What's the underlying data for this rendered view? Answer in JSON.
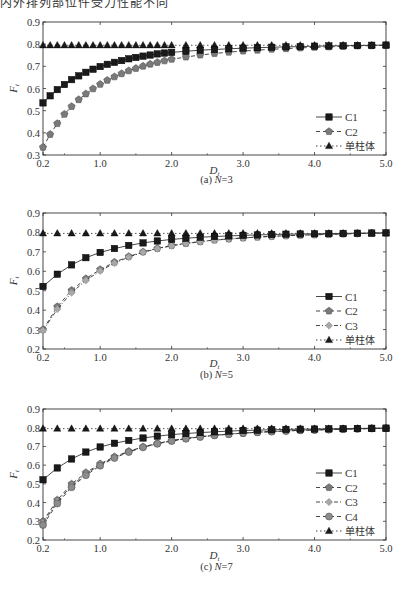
{
  "page": {
    "top_text": "内外排列部位件受力性能不同"
  },
  "chart_data": [
    {
      "type": "line",
      "title": "",
      "caption": "(a) N=3",
      "caption_prefix": "(a) ",
      "caption_var": "N",
      "caption_value": "=3",
      "xlabel": "D",
      "xlabel_sub": "t",
      "ylabel": "F",
      "ylabel_sub": "t",
      "xlim": [
        0.2,
        5.0
      ],
      "ylim": [
        0.3,
        0.9
      ],
      "xticks": [
        0.2,
        1.0,
        2.0,
        3.0,
        4.0,
        5.0
      ],
      "xtick_labels": [
        "0.2",
        "1.0",
        "2.0",
        "3.0",
        "4.0",
        "5.0"
      ],
      "yticks": [
        0.3,
        0.4,
        0.5,
        0.6,
        0.7,
        0.8,
        0.9
      ],
      "ytick_labels": [
        "0.3",
        "0.4",
        "0.5",
        "0.6",
        "0.7",
        "0.8",
        "0.9"
      ],
      "grid": false,
      "legend_position": "lower right",
      "x": [
        0.2,
        0.3,
        0.4,
        0.5,
        0.6,
        0.7,
        0.8,
        0.9,
        1.0,
        1.1,
        1.2,
        1.3,
        1.4,
        1.5,
        1.6,
        1.7,
        1.8,
        1.9,
        2.0,
        2.2,
        2.4,
        2.6,
        2.8,
        3.0,
        3.2,
        3.4,
        3.6,
        3.8,
        4.0,
        4.2,
        4.4,
        4.6,
        4.8,
        5.0
      ],
      "series": [
        {
          "name": "C1",
          "style": "solid",
          "marker": "square",
          "color": "#1a1a1a",
          "values": [
            0.535,
            0.567,
            0.595,
            0.618,
            0.64,
            0.657,
            0.673,
            0.687,
            0.699,
            0.709,
            0.718,
            0.726,
            0.734,
            0.74,
            0.746,
            0.751,
            0.756,
            0.76,
            0.763,
            0.768,
            0.773,
            0.776,
            0.779,
            0.782,
            0.784,
            0.786,
            0.788,
            0.789,
            0.791,
            0.792,
            0.793,
            0.794,
            0.795,
            0.796
          ]
        },
        {
          "name": "C2",
          "style": "dashed",
          "marker": "pentagon",
          "color": "#7a7a7a",
          "values": [
            0.335,
            0.393,
            0.442,
            0.484,
            0.519,
            0.55,
            0.576,
            0.599,
            0.619,
            0.637,
            0.653,
            0.667,
            0.68,
            0.691,
            0.701,
            0.71,
            0.718,
            0.725,
            0.732,
            0.742,
            0.751,
            0.758,
            0.764,
            0.769,
            0.773,
            0.777,
            0.78,
            0.783,
            0.786,
            0.788,
            0.79,
            0.792,
            0.793,
            0.795
          ]
        },
        {
          "name": "单柱体",
          "style": "dotted",
          "marker": "triangle",
          "color": "#1a1a1a",
          "values": [
            0.795,
            0.795,
            0.795,
            0.795,
            0.795,
            0.795,
            0.795,
            0.795,
            0.795,
            0.795,
            0.795,
            0.795,
            0.795,
            0.795,
            0.795,
            0.795,
            0.795,
            0.795,
            0.795,
            0.795,
            0.795,
            0.795,
            0.795,
            0.795,
            0.795,
            0.795,
            0.795,
            0.795,
            0.795,
            0.795,
            0.795,
            0.795,
            0.795,
            0.795
          ]
        }
      ]
    },
    {
      "type": "line",
      "title": "",
      "caption": "(b) N=5",
      "caption_prefix": "(b) ",
      "caption_var": "N",
      "caption_value": "=5",
      "xlabel": "D",
      "xlabel_sub": "t",
      "ylabel": "F",
      "ylabel_sub": "t",
      "xlim": [
        0.2,
        5.0
      ],
      "ylim": [
        0.2,
        0.9
      ],
      "xticks": [
        0.2,
        1.0,
        2.0,
        3.0,
        4.0,
        5.0
      ],
      "xtick_labels": [
        "0.2",
        "1.0",
        "2.0",
        "3.0",
        "4.0",
        "5.0"
      ],
      "yticks": [
        0.2,
        0.3,
        0.4,
        0.5,
        0.6,
        0.7,
        0.8,
        0.9
      ],
      "ytick_labels": [
        "0.2",
        "0.3",
        "0.4",
        "0.5",
        "0.6",
        "0.7",
        "0.8",
        "0.9"
      ],
      "grid": false,
      "legend_position": "lower right",
      "x": [
        0.2,
        0.4,
        0.6,
        0.8,
        1.0,
        1.2,
        1.4,
        1.6,
        1.8,
        2.0,
        2.2,
        2.4,
        2.6,
        2.8,
        3.0,
        3.2,
        3.4,
        3.6,
        3.8,
        4.0,
        4.2,
        4.4,
        4.6,
        4.8,
        5.0
      ],
      "series": [
        {
          "name": "C1",
          "style": "solid",
          "marker": "square",
          "color": "#1a1a1a",
          "values": [
            0.522,
            0.585,
            0.633,
            0.67,
            0.697,
            0.717,
            0.733,
            0.746,
            0.756,
            0.764,
            0.77,
            0.775,
            0.779,
            0.782,
            0.785,
            0.787,
            0.789,
            0.791,
            0.792,
            0.793,
            0.794,
            0.795,
            0.796,
            0.797,
            0.798
          ]
        },
        {
          "name": "C2",
          "style": "dashed",
          "marker": "pentagon",
          "color": "#7a7a7a",
          "values": [
            0.3,
            0.418,
            0.502,
            0.562,
            0.609,
            0.647,
            0.676,
            0.7,
            0.718,
            0.733,
            0.744,
            0.753,
            0.761,
            0.767,
            0.772,
            0.776,
            0.78,
            0.783,
            0.786,
            0.788,
            0.79,
            0.792,
            0.794,
            0.796,
            0.797
          ]
        },
        {
          "name": "C3",
          "style": "dashdot",
          "marker": "diamond",
          "color": "#a8a8a8",
          "values": [
            0.295,
            0.405,
            0.49,
            0.553,
            0.602,
            0.642,
            0.673,
            0.698,
            0.716,
            0.731,
            0.743,
            0.752,
            0.76,
            0.766,
            0.771,
            0.776,
            0.78,
            0.783,
            0.786,
            0.788,
            0.79,
            0.792,
            0.794,
            0.796,
            0.797
          ]
        },
        {
          "name": "单柱体",
          "style": "dotted",
          "marker": "triangle",
          "color": "#1a1a1a",
          "values": [
            0.795,
            0.795,
            0.795,
            0.795,
            0.795,
            0.795,
            0.795,
            0.795,
            0.795,
            0.795,
            0.795,
            0.795,
            0.795,
            0.795,
            0.795,
            0.795,
            0.795,
            0.795,
            0.795,
            0.795,
            0.795,
            0.795,
            0.795,
            0.795,
            0.795
          ]
        }
      ]
    },
    {
      "type": "line",
      "title": "",
      "caption": "(c) N=7",
      "caption_prefix": "(c) ",
      "caption_var": "N",
      "caption_value": "=7",
      "xlabel": "D",
      "xlabel_sub": "t",
      "ylabel": "F",
      "ylabel_sub": "t",
      "xlim": [
        0.2,
        5.0
      ],
      "ylim": [
        0.2,
        0.9
      ],
      "xticks": [
        0.2,
        1.0,
        2.0,
        3.0,
        4.0,
        5.0
      ],
      "xtick_labels": [
        "0.2",
        "1.0",
        "2.0",
        "3.0",
        "4.0",
        "5.0"
      ],
      "yticks": [
        0.2,
        0.3,
        0.4,
        0.5,
        0.6,
        0.7,
        0.8,
        0.9
      ],
      "ytick_labels": [
        "0.2",
        "0.3",
        "0.4",
        "0.5",
        "0.6",
        "0.7",
        "0.8",
        "0.9"
      ],
      "grid": false,
      "legend_position": "lower right",
      "x": [
        0.2,
        0.4,
        0.6,
        0.8,
        1.0,
        1.2,
        1.4,
        1.6,
        1.8,
        2.0,
        2.2,
        2.4,
        2.6,
        2.8,
        3.0,
        3.2,
        3.4,
        3.6,
        3.8,
        4.0,
        4.2,
        4.4,
        4.6,
        4.8,
        5.0
      ],
      "series": [
        {
          "name": "C1",
          "style": "solid",
          "marker": "square",
          "color": "#1a1a1a",
          "values": [
            0.522,
            0.585,
            0.633,
            0.67,
            0.697,
            0.717,
            0.732,
            0.745,
            0.755,
            0.763,
            0.769,
            0.774,
            0.778,
            0.782,
            0.785,
            0.787,
            0.789,
            0.791,
            0.792,
            0.793,
            0.794,
            0.795,
            0.796,
            0.797,
            0.798
          ]
        },
        {
          "name": "C2",
          "style": "dashed",
          "marker": "pentagon",
          "color": "#7a7a7a",
          "values": [
            0.3,
            0.414,
            0.499,
            0.56,
            0.607,
            0.645,
            0.674,
            0.698,
            0.716,
            0.731,
            0.743,
            0.752,
            0.76,
            0.766,
            0.771,
            0.776,
            0.78,
            0.783,
            0.786,
            0.788,
            0.79,
            0.792,
            0.794,
            0.796,
            0.797
          ]
        },
        {
          "name": "C3",
          "style": "dashdot",
          "marker": "diamond",
          "color": "#a8a8a8",
          "values": [
            0.29,
            0.405,
            0.49,
            0.553,
            0.602,
            0.642,
            0.672,
            0.697,
            0.715,
            0.73,
            0.742,
            0.751,
            0.759,
            0.766,
            0.771,
            0.776,
            0.78,
            0.783,
            0.786,
            0.788,
            0.79,
            0.792,
            0.794,
            0.796,
            0.797
          ]
        },
        {
          "name": "C4",
          "style": "dashed",
          "marker": "circle",
          "color": "#8c8c8c",
          "values": [
            0.28,
            0.395,
            0.482,
            0.546,
            0.597,
            0.638,
            0.67,
            0.695,
            0.714,
            0.729,
            0.741,
            0.751,
            0.759,
            0.765,
            0.771,
            0.775,
            0.779,
            0.783,
            0.786,
            0.788,
            0.79,
            0.792,
            0.794,
            0.796,
            0.797
          ]
        },
        {
          "name": "单柱体",
          "style": "dotted",
          "marker": "triangle",
          "color": "#1a1a1a",
          "values": [
            0.795,
            0.795,
            0.795,
            0.795,
            0.795,
            0.795,
            0.795,
            0.795,
            0.795,
            0.795,
            0.795,
            0.795,
            0.795,
            0.795,
            0.795,
            0.795,
            0.795,
            0.795,
            0.795,
            0.795,
            0.795,
            0.795,
            0.795,
            0.795,
            0.795
          ]
        }
      ]
    }
  ]
}
